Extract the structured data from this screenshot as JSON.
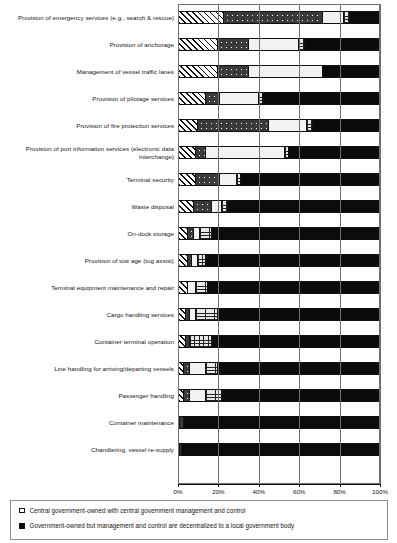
{
  "chart_data": {
    "type": "bar",
    "orientation": "horizontal",
    "stacked": true,
    "stack_mode": "percent",
    "title": "",
    "subtitle": "",
    "xlabel": "",
    "ylabel": "",
    "xlim": [
      0,
      100
    ],
    "xticks": [
      0,
      20,
      40,
      60,
      80,
      100
    ],
    "xtick_labels": [
      "0%",
      "20%",
      "40%",
      "60%",
      "80%",
      "100%"
    ],
    "grid": true,
    "grid_axis": "x",
    "legend_position": "bottom",
    "categories": [
      "Provision of emergency services (e.g., search & rescue)",
      "Provision of anchorage",
      "Management of vessel traffic lanes",
      "Provision of pilotage services",
      "Provision of fire protection services",
      "Provision of port information services (electronic data interchange)",
      "Terminal security",
      "Waste disposal",
      "On-dock storage",
      "Provision of tow age (tug assist)",
      "Terminal equipment maintenance and repair",
      "Cargo handling services",
      "Container terminal operation",
      "Line handling for arriving/departing vessels",
      "Passenger handling",
      "Container maintenance",
      "Chandlering, vessel re-supply"
    ],
    "series": [
      {
        "name": "Central government-owned with central government management and control",
        "pattern": "diagonal-hatch",
        "color": "#ffffff",
        "values": [
          23,
          20,
          20,
          14,
          10,
          9,
          9,
          8,
          5,
          5,
          5,
          4,
          4,
          3,
          3,
          1,
          1
        ]
      },
      {
        "name": "Government-owned but management and control are decentralized to a local government body",
        "pattern": "dark-speckle",
        "color": "#3a3a3a",
        "values": [
          49,
          15,
          15,
          7,
          35,
          5,
          12,
          9,
          3,
          2,
          0,
          2,
          2,
          3,
          3,
          2,
          1
        ]
      },
      {
        "name": "series-3",
        "pattern": "plain-light",
        "color": "#f2f2f2",
        "values": [
          10,
          25,
          37,
          19,
          19,
          39,
          8,
          5,
          3,
          3,
          4,
          3,
          0,
          8,
          8,
          0,
          0
        ]
      },
      {
        "name": "series-4",
        "pattern": "brick-hatch",
        "color": "#e8e8e8",
        "values": [
          3,
          3,
          0,
          2,
          3,
          2,
          2,
          3,
          6,
          4,
          6,
          11,
          11,
          6,
          8,
          0,
          0
        ]
      },
      {
        "name": "series-5",
        "pattern": "solid-black",
        "color": "#0b0b0b",
        "values": [
          15,
          37,
          28,
          58,
          33,
          45,
          69,
          75,
          83,
          86,
          85,
          80,
          83,
          80,
          78,
          97,
          98
        ]
      }
    ]
  },
  "legend": {
    "items": [
      {
        "swatch": "open-square",
        "label": "Central government-owned with central government management and control"
      },
      {
        "swatch": "filled-square",
        "label": "Government-owned but management and control are decentralized to a local government body"
      }
    ]
  }
}
